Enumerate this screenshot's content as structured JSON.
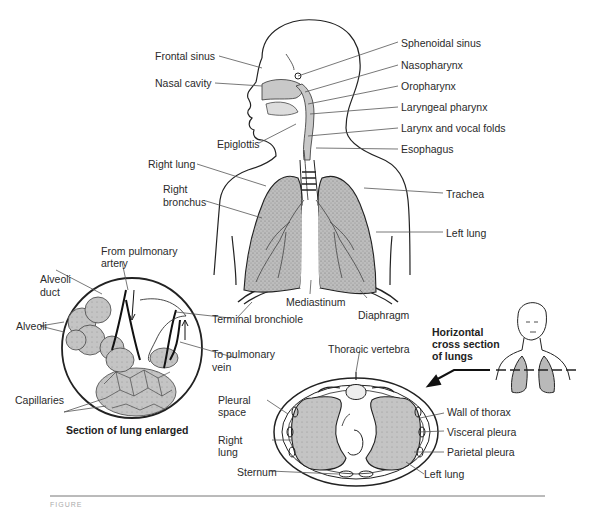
{
  "figure": {
    "colors": {
      "line": "#222222",
      "lung_fill": "#b9b9b9",
      "leader": "#555555",
      "background": "#ffffff"
    },
    "main_labels": {
      "frontal_sinus": "Frontal sinus",
      "nasal_cavity": "Nasal cavity",
      "sphenoidal_sinus": "Sphenoidal sinus",
      "nasopharynx": "Nasopharynx",
      "oropharynx": "Oropharynx",
      "laryngeal_pharynx": "Laryngeal pharynx",
      "larynx_vocal_folds": "Larynx and vocal folds",
      "epiglottis": "Epiglottis",
      "esophagus": "Esophagus",
      "right_lung": "Right lung",
      "right_bronchus_1": "Right",
      "right_bronchus_2": "bronchus",
      "trachea": "Trachea",
      "left_lung": "Left lung",
      "mediastinum": "Mediastinum",
      "diaphragm": "Diaphragm",
      "terminal_bronchiole": "Terminal bronchiole"
    },
    "enlarged_section": {
      "title": "Section of lung enlarged",
      "from_pulmonary_1": "From pulmonary",
      "from_pulmonary_2": "artery",
      "alveoli_duct_1": "Alveoli",
      "alveoli_duct_2": "duct",
      "alveoli": "Alveoli",
      "to_pulmonary_1": "To pulmonary",
      "to_pulmonary_2": "vein",
      "capillaries": "Capillaries"
    },
    "cross_section": {
      "title_1": "Horizontal",
      "title_2": "cross section",
      "title_3": "of lungs",
      "thoracic_vertebra": "Thoracic vertebra",
      "pleural_space_1": "Pleural",
      "pleural_space_2": "space",
      "right_lung_1": "Right",
      "right_lung_2": "lung",
      "sternum": "Sternum",
      "wall_of_thorax": "Wall of thorax",
      "visceral_pleura": "Visceral pleura",
      "parietal_pleura": "Parietal pleura",
      "left_lung": "Left lung"
    },
    "caption_partial": "FIGURE"
  }
}
